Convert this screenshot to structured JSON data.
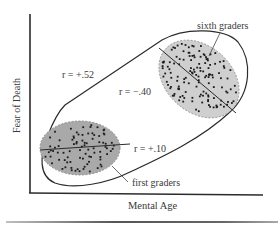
{
  "figure": {
    "type": "correlation-scatter-diagram",
    "axes": {
      "x_label": "Mental Age",
      "y_label": "Fear of Death"
    },
    "groups": [
      {
        "name": "first graders",
        "label": "first graders",
        "correlation_label": "r = +.10",
        "fill": "#a9a9a9"
      },
      {
        "name": "sixth graders",
        "label": "sixth graders",
        "correlation_label": "r = −.40",
        "fill": "#cfcfcf"
      }
    ],
    "combined": {
      "correlation_label": "r = +.52"
    },
    "colors": {
      "ink": "#2b2b2b",
      "text": "#3a3a3a",
      "dot": "#1a1a1a",
      "first_fill": "#a9a9a9",
      "sixth_fill": "#cfcfcf",
      "background": "#ffffff"
    }
  }
}
